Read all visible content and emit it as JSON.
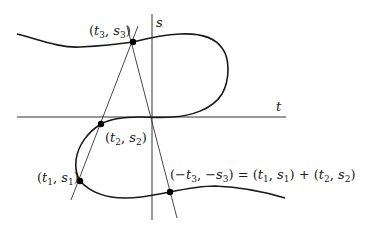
{
  "figure": {
    "type": "elliptic-curve-addition-diagram",
    "axes": {
      "horizontal_label": "t",
      "vertical_label": "s"
    },
    "points": [
      {
        "id": "p3",
        "label": "(t3,s3)",
        "x": 133,
        "y": 42
      },
      {
        "id": "p2",
        "label": "(t2,s2)",
        "x": 101,
        "y": 124
      },
      {
        "id": "p1",
        "label": "(t1,s1)",
        "x": 80,
        "y": 181
      },
      {
        "id": "sum",
        "label": "(−t3,−s3) = (t1,s1) + (t2,s2)",
        "x": 170,
        "y": 192
      }
    ],
    "labels": {
      "s": "s",
      "t": "t",
      "p3": {
        "open": "(",
        "t": "t",
        "t_sub": "3",
        "comma": ", ",
        "s": "s",
        "s_sub": "3",
        "close": ")"
      },
      "p2": {
        "open": "(",
        "t": "t",
        "t_sub": "2",
        "comma": ", ",
        "s": "s",
        "s_sub": "2",
        "close": ")"
      },
      "p1": {
        "open": "(",
        "t": "t",
        "t_sub": "1",
        "comma": ", ",
        "s": "s",
        "s_sub": "1",
        "close": ")"
      },
      "sum": {
        "lhs_open": "(−",
        "t": "t",
        "t_sub": "3",
        "comma": ", −",
        "s": "s",
        "s_sub": "3",
        "lhs_close": ") = (",
        "t1": "t",
        "t1_sub": "1",
        "c1": ", ",
        "s1": "s",
        "s1_sub": "1",
        "mid": ") + (",
        "t2": "t",
        "t2_sub": "2",
        "c2": ", ",
        "s2": "s",
        "s2_sub": "2",
        "end": ")"
      }
    },
    "colors": {
      "curve": "#1a1a1a",
      "axis": "#333333",
      "line": "#333333",
      "point": "#000000"
    }
  }
}
